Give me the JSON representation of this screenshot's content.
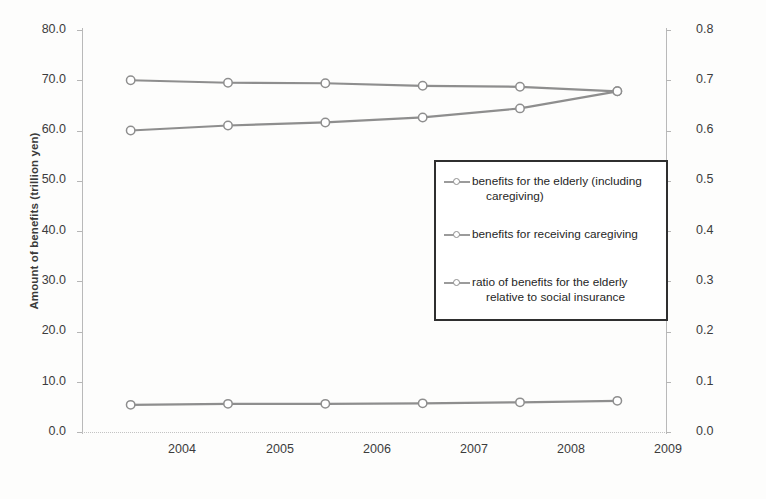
{
  "chart_data": {
    "type": "line",
    "title": "",
    "xlabel": "",
    "ylabel": "Amount of benefits (trillion yen)",
    "y2label": "Ratio of benefits",
    "categories": [
      "2004",
      "2005",
      "2006",
      "2007",
      "2008",
      "2009"
    ],
    "x": [
      2004,
      2005,
      2006,
      2007,
      2008,
      2009
    ],
    "ylim": [
      0.0,
      80.0
    ],
    "y2lim": [
      0.0,
      0.8
    ],
    "yticks": [
      "0.0",
      "10.0",
      "20.0",
      "30.0",
      "40.0",
      "50.0",
      "60.0",
      "70.0",
      "80.0"
    ],
    "y2ticks": [
      "0.0",
      "0.1",
      "0.2",
      "0.3",
      "0.4",
      "0.5",
      "0.6",
      "0.7",
      "0.8"
    ],
    "grid": false,
    "legend_position": "center",
    "series": [
      {
        "name": "benefits for the elderly (including caregiving)",
        "axis": "right",
        "marker": "circle-open",
        "color": "#8e8e8e",
        "values": [
          0.7,
          0.695,
          0.694,
          0.689,
          0.687,
          0.678
        ]
      },
      {
        "name": "benefits for receiving caregiving",
        "axis": "left",
        "marker": "circle-open",
        "color": "#8e8e8e",
        "values": [
          60.0,
          61.0,
          61.6,
          62.6,
          64.4,
          67.8
        ]
      },
      {
        "name": "ratio of benefits for the elderly relative to social insurance",
        "axis": "left",
        "marker": "circle-open",
        "color": "#8e8e8e",
        "values": [
          5.4,
          5.6,
          5.6,
          5.7,
          5.9,
          6.2
        ]
      }
    ]
  },
  "axes": {
    "left": {
      "title": "Amount of benefits (trillion yen)",
      "ticks": [
        "80.0",
        "70.0",
        "60.0",
        "50.0",
        "40.0",
        "30.0",
        "20.0",
        "10.0",
        "0.0"
      ]
    },
    "right": {
      "title": "Ratio of benefits",
      "ticks": [
        "0.8",
        "0.7",
        "0.6",
        "0.5",
        "0.4",
        "0.3",
        "0.2",
        "0.1",
        "0.0"
      ]
    },
    "bottom": {
      "ticks": [
        "2004",
        "2005",
        "2006",
        "2007",
        "2008",
        "2009"
      ]
    }
  },
  "legend": {
    "items": [
      {
        "line1": "benefits for the elderly (including",
        "line2": "caregiving)"
      },
      {
        "line1": "benefits for receiving caregiving",
        "line2": ""
      },
      {
        "line1": "ratio of benefits for the elderly",
        "line2": "relative to social insurance"
      }
    ]
  },
  "colors": {
    "series": "#8e8e8e",
    "axis": "#b9b9b9",
    "legend_border": "#2f2f2f",
    "text": "#3c3c3c"
  }
}
